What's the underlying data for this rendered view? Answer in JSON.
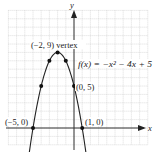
{
  "chart_data": {
    "type": "line",
    "title": "",
    "function_label": "f(x) = −x² − 4x + 5",
    "xlabel": "x",
    "ylabel": "y",
    "xlim": [
      -8,
      9
    ],
    "ylim": [
      -2,
      14
    ],
    "grid": true,
    "curve": {
      "a": -1,
      "b": -4,
      "c": 5,
      "x_from": -5.8,
      "x_to": 1.8
    },
    "points": [
      {
        "x": -5,
        "y": 0,
        "label": "(−5, 0)"
      },
      {
        "x": -4,
        "y": 5,
        "label": ""
      },
      {
        "x": -3,
        "y": 8,
        "label": ""
      },
      {
        "x": -2,
        "y": 9,
        "label": "(−2, 9) vertex"
      },
      {
        "x": -1,
        "y": 8,
        "label": ""
      },
      {
        "x": 0,
        "y": 5,
        "label": "(0, 5)"
      },
      {
        "x": 1,
        "y": 0,
        "label": "(1, 0)"
      }
    ]
  },
  "labels": {
    "vertex": "(−2, 9) vertex",
    "function": "f(x) = −x² − 4x + 5",
    "y_intercept": "(0, 5)",
    "root_left": "(−5, 0)",
    "root_right": "(1, 0)",
    "x_axis": "x",
    "y_axis": "y"
  }
}
